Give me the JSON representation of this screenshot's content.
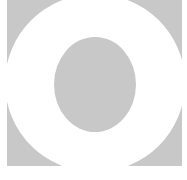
{
  "graphic": {
    "description": "Gray square with white ring and gray oval center",
    "colors": {
      "background": "#ffffff",
      "square": "#c8c8c8",
      "ring": "#ffffff",
      "center": "#c8c8c8"
    }
  }
}
